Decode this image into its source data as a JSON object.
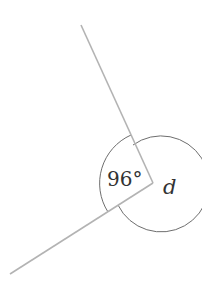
{
  "diagram": {
    "vertex": {
      "x": 153,
      "y": 183
    },
    "rays": [
      {
        "name": "upper-ray",
        "x2": 81,
        "y2": 25
      },
      {
        "name": "lower-ray",
        "x2": 10,
        "y2": 274
      }
    ],
    "angles": [
      {
        "name": "given-angle",
        "label": "96°",
        "value_deg": 96
      },
      {
        "name": "unknown-angle",
        "label": "d"
      }
    ],
    "colors": {
      "rays": "#b3b3b3",
      "arcs": "#6e6e6e",
      "text": "#333333"
    }
  }
}
